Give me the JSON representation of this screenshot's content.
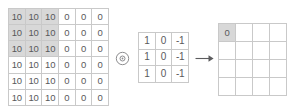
{
  "diagram": {
    "colors": {
      "border": "#c9c9c9",
      "text": "#59595b",
      "highlight": "#d8d8d8",
      "background": "#ffffff"
    }
  },
  "input_matrix": {
    "label": "input-matrix",
    "rows": 6,
    "cols": 6,
    "values": [
      [
        "10",
        "10",
        "10",
        "0",
        "0",
        "0"
      ],
      [
        "10",
        "10",
        "10",
        "0",
        "0",
        "0"
      ],
      [
        "10",
        "10",
        "10",
        "0",
        "0",
        "0"
      ],
      [
        "10",
        "10",
        "10",
        "0",
        "0",
        "0"
      ],
      [
        "10",
        "10",
        "10",
        "0",
        "0",
        "0"
      ],
      [
        "10",
        "10",
        "10",
        "0",
        "0",
        "0"
      ]
    ],
    "highlighted": [
      [
        0,
        0
      ],
      [
        0,
        1
      ],
      [
        0,
        2
      ],
      [
        1,
        0
      ],
      [
        1,
        1
      ],
      [
        1,
        2
      ],
      [
        2,
        0
      ],
      [
        2,
        1
      ],
      [
        2,
        2
      ]
    ]
  },
  "operator": {
    "symbol": "⊛",
    "name": "convolution-operator"
  },
  "kernel_matrix": {
    "label": "kernel-matrix",
    "rows": 3,
    "cols": 3,
    "values": [
      [
        "1",
        "0",
        "-1"
      ],
      [
        "1",
        "0",
        "-1"
      ],
      [
        "1",
        "0",
        "-1"
      ]
    ],
    "highlighted": []
  },
  "arrow": {
    "symbol": "→",
    "name": "result-arrow"
  },
  "output_matrix": {
    "label": "output-matrix",
    "rows": 4,
    "cols": 4,
    "values": [
      [
        "0",
        "",
        "",
        ""
      ],
      [
        "",
        "",
        "",
        ""
      ],
      [
        "",
        "",
        "",
        ""
      ],
      [
        "",
        "",
        "",
        ""
      ]
    ],
    "highlighted": [
      [
        0,
        0
      ]
    ]
  }
}
